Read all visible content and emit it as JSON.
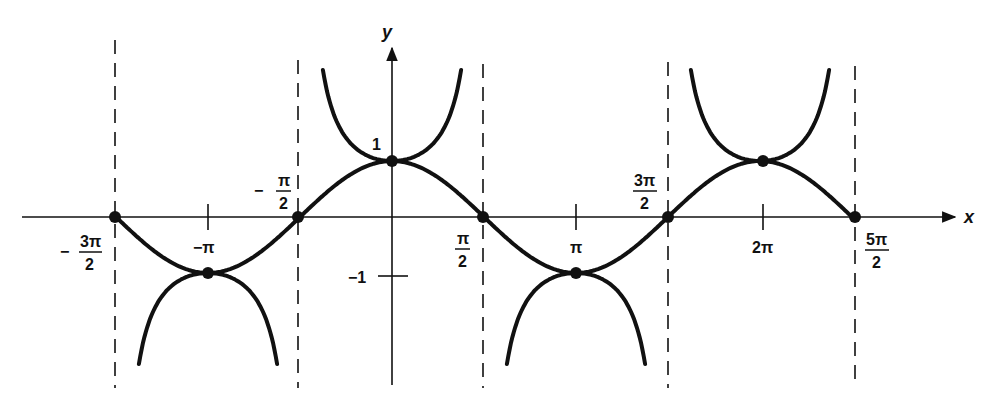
{
  "chart_data": {
    "type": "line",
    "title": "",
    "xlabel": "x",
    "ylabel": "y",
    "series": [
      {
        "name": "y = cos x",
        "x_range": [
          "-3π/2",
          "5π/2"
        ],
        "style": "solid bold curve"
      },
      {
        "name": "y = sec x (branches near extrema)",
        "branches": [
          {
            "center": "-π",
            "vertex_y": -1,
            "opens": "down"
          },
          {
            "center": "0",
            "vertex_y": 1,
            "opens": "up"
          },
          {
            "center": "π",
            "vertex_y": -1,
            "opens": "down"
          },
          {
            "center": "2π",
            "vertex_y": 1,
            "opens": "up"
          }
        ],
        "style": "solid bold curve"
      }
    ],
    "asymptotes": [
      "-3π/2",
      "-π/2",
      "π/2",
      "3π/2",
      "5π/2"
    ],
    "asymptote_style": "dashed vertical",
    "marked_points": [
      {
        "x": "-3π/2",
        "y": 0
      },
      {
        "x": "-π",
        "y": -1
      },
      {
        "x": "-π/2",
        "y": 0
      },
      {
        "x": "0",
        "y": 1
      },
      {
        "x": "π/2",
        "y": 0
      },
      {
        "x": "π",
        "y": -1
      },
      {
        "x": "3π/2",
        "y": 0
      },
      {
        "x": "2π",
        "y": 1
      },
      {
        "x": "5π/2",
        "y": 0
      }
    ],
    "x_ticks": [
      "-3π/2",
      "-π",
      "-π/2",
      "π/2",
      "π",
      "3π/2",
      "2π",
      "5π/2"
    ],
    "y_ticks": [
      "1",
      "-1"
    ],
    "grid": false,
    "legend": null
  },
  "labels": {
    "x_axis": "x",
    "y_axis": "y",
    "y_one": "1",
    "y_neg_one": "−1",
    "neg_three_pi_over_2": {
      "sign": "−",
      "num": "3π",
      "den": "2"
    },
    "neg_pi": "−π",
    "neg_pi_over_2": {
      "sign": "−",
      "num": "π",
      "den": "2"
    },
    "pi_over_2": {
      "num": "π",
      "den": "2"
    },
    "pi": "π",
    "three_pi_over_2": {
      "num": "3π",
      "den": "2"
    },
    "two_pi": "2π",
    "five_pi_over_2": {
      "num": "5π",
      "den": "2"
    }
  }
}
